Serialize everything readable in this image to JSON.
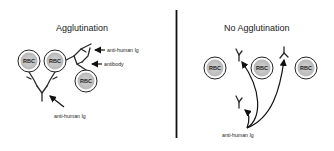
{
  "diagram": {
    "left_panel": {
      "title": "Agglutination",
      "cells": [
        {
          "label": "RBC"
        },
        {
          "label": "RBC"
        },
        {
          "label": "RBC"
        }
      ],
      "annotations": {
        "anti_human_ig_top": "anti-human Ig",
        "antibody": "antibody",
        "anti_human_ig_bottom": "anti-human Ig"
      }
    },
    "right_panel": {
      "title": "No Agglutination",
      "cells": [
        {
          "label": "RBC"
        },
        {
          "label": "RBC"
        },
        {
          "label": "RBC"
        }
      ],
      "annotations": {
        "anti_human_ig": "anti-human Ig"
      }
    },
    "colors": {
      "cell_fill": "#c8c8c8",
      "line": "#1a1a1a",
      "background": "#ffffff"
    }
  }
}
